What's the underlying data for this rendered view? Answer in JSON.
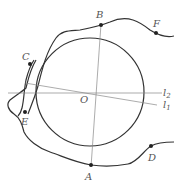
{
  "diagram": {
    "colors": {
      "stroke": "#333333",
      "thin": "#888888",
      "label": "#555555",
      "point": "#222222"
    },
    "labels": {
      "A": "A",
      "B": "B",
      "C": "C",
      "D": "D",
      "E": "E",
      "F": "F",
      "O": "O",
      "l1_main": "l",
      "l1_sub": "1",
      "l2_main": "l",
      "l2_sub": "2"
    },
    "circle": {
      "cx": 90,
      "cy": 92,
      "r": 54
    },
    "points": {
      "A": [
        91,
        165
      ],
      "B": [
        101,
        25
      ],
      "C": [
        30,
        64
      ],
      "D": [
        151,
        146
      ],
      "E": [
        25,
        112
      ],
      "F": [
        156,
        33
      ]
    }
  }
}
